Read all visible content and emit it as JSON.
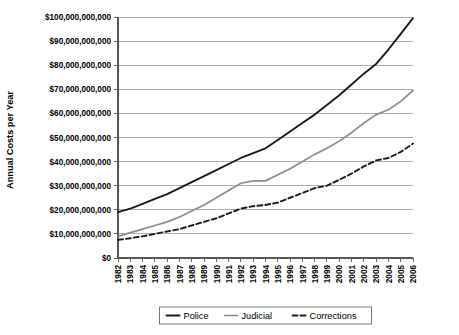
{
  "chart_data": {
    "type": "line",
    "title": "",
    "xlabel": "",
    "ylabel": "Annual Costs per Year",
    "ylim": [
      0,
      100000000000
    ],
    "ytick_step": 10000000000,
    "grid": true,
    "legend_position": "bottom",
    "categories": [
      "1982",
      "1983",
      "1984",
      "1985",
      "1986",
      "1987",
      "1988",
      "1989",
      "1990",
      "1991",
      "1992",
      "1993",
      "1994",
      "1995",
      "1996",
      "1997",
      "1998",
      "1999",
      "2000",
      "2001",
      "2002",
      "2003",
      "2004",
      "2005",
      "2006"
    ],
    "ytick_labels": [
      "$0",
      "$10,000,000,000",
      "$20,000,000,000",
      "$30,000,000,000",
      "$40,000,000,000",
      "$50,000,000,000",
      "$60,000,000,000",
      "$70,000,000,000",
      "$80,000,000,000",
      "$90,000,000,000",
      "$100,000,000,000"
    ],
    "ytick_values": [
      0,
      10000000000,
      20000000000,
      30000000000,
      40000000000,
      50000000000,
      60000000000,
      70000000000,
      80000000000,
      90000000000,
      100000000000
    ],
    "series": [
      {
        "name": "Police",
        "color": "#1a1a1a",
        "width": 1.9,
        "dash": "none",
        "values": [
          19000000000,
          20500000000,
          22500000000,
          24500000000,
          26500000000,
          29000000000,
          31500000000,
          34000000000,
          36500000000,
          39000000000,
          41500000000,
          43500000000,
          45500000000,
          49000000000,
          52500000000,
          56000000000,
          59500000000,
          63500000000,
          67500000000,
          72000000000,
          76500000000,
          80500000000,
          86500000000,
          93000000000,
          99500000000
        ]
      },
      {
        "name": "Judicial",
        "color": "#8d8d8d",
        "width": 1.7,
        "dash": "none",
        "values": [
          9000000000,
          10500000000,
          12000000000,
          13500000000,
          15000000000,
          17000000000,
          19500000000,
          22000000000,
          25000000000,
          28000000000,
          31000000000,
          32000000000,
          32000000000,
          34500000000,
          37000000000,
          40000000000,
          43000000000,
          45500000000,
          48500000000,
          52000000000,
          56000000000,
          59500000000,
          61500000000,
          65000000000,
          69500000000
        ]
      },
      {
        "name": "Corrections",
        "color": "#1a1a1a",
        "width": 1.9,
        "dash": "5,3",
        "values": [
          7500000000,
          8200000000,
          9000000000,
          10000000000,
          11000000000,
          12000000000,
          13500000000,
          15000000000,
          16500000000,
          18500000000,
          20500000000,
          21500000000,
          22000000000,
          23000000000,
          25000000000,
          27000000000,
          29000000000,
          30000000000,
          32500000000,
          35000000000,
          38000000000,
          40500000000,
          41500000000,
          44000000000,
          47500000000
        ]
      }
    ],
    "legend": [
      {
        "label": "Police",
        "color": "#1a1a1a",
        "dash": "none",
        "width": 1.9
      },
      {
        "label": "Judicial",
        "color": "#8d8d8d",
        "dash": "none",
        "width": 1.7
      },
      {
        "label": "Corrections",
        "color": "#1a1a1a",
        "dash": "5,3",
        "width": 1.9
      }
    ]
  }
}
